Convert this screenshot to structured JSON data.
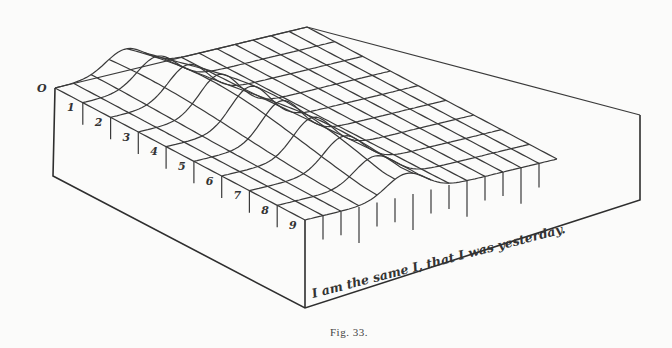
{
  "figure": {
    "origin_label": "O",
    "axis_labels": [
      "1",
      "2",
      "3",
      "4",
      "5",
      "6",
      "7",
      "8",
      "9"
    ],
    "front_caption": "I am the same I, that I was yesterday.",
    "figure_caption": "Fig. 33."
  },
  "colors": {
    "ink": "#333333",
    "paper": "#fbfbfa"
  }
}
